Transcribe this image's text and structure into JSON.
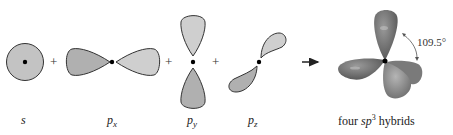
{
  "orbitals": [
    {
      "id": "s",
      "label_main": "s",
      "label_sub": ""
    },
    {
      "id": "px",
      "label_main": "p",
      "label_sub": "x"
    },
    {
      "id": "py",
      "label_main": "p",
      "label_sub": "y"
    },
    {
      "id": "pz",
      "label_main": "p",
      "label_sub": "z"
    }
  ],
  "operators": [
    "+",
    "+",
    "+"
  ],
  "result": {
    "caption_pre": "four ",
    "caption_sp": "sp",
    "caption_sup": "3",
    "caption_post": " hybrids",
    "angle_label": "109.5°"
  },
  "colors": {
    "lobe_dark": "#a9a9a9",
    "lobe_light": "#c9c9c9",
    "outline": "#333333",
    "hybrid_dark": "#6e6e6e",
    "hybrid_light": "#9a9a9a"
  }
}
